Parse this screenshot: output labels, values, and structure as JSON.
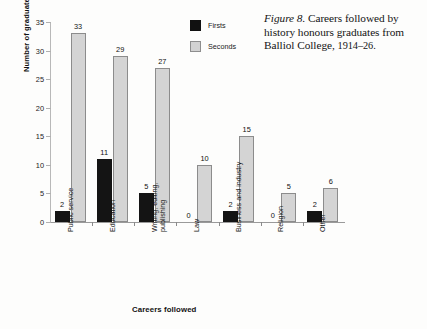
{
  "caption": {
    "figure_label": "Figure 8.",
    "text": " Careers followed by history honours graduates from Balliol College,",
    "years": "1914–26."
  },
  "legend": {
    "position": "inside-top-center",
    "items": [
      {
        "name": "Firsts",
        "color": "#141414"
      },
      {
        "name": "Seconds",
        "color": "#d4d4d4"
      }
    ]
  },
  "axes": {
    "ylabel": "Number of graduates",
    "xlabel": "Careers followed",
    "yticks": [
      "0",
      "5",
      "10",
      "15",
      "20",
      "25",
      "30",
      "35"
    ]
  },
  "chart_data": {
    "type": "bar",
    "title": "Careers followed by history honours graduates from Balliol College, 1914–26.",
    "xlabel": "Careers followed",
    "ylabel": "Number of graduates",
    "ylim": [
      0,
      35
    ],
    "ytick_step": 5,
    "grid": false,
    "legend_position": "upper center inside",
    "categories": [
      "Public service",
      "Education",
      "Writing, editing, publishing",
      "Law",
      "Business and industry",
      "Religion",
      "Other"
    ],
    "category_lines": [
      [
        "Public service"
      ],
      [
        "Education"
      ],
      [
        "Writing, editing,",
        "publishing"
      ],
      [
        "Law"
      ],
      [
        "Business and industry"
      ],
      [
        "Religion"
      ],
      [
        "Other"
      ]
    ],
    "series": [
      {
        "name": "Firsts",
        "color": "#141414",
        "values": [
          2,
          11,
          5,
          0,
          2,
          0,
          2
        ]
      },
      {
        "name": "Seconds",
        "color": "#d4d4d4",
        "values": [
          33,
          29,
          27,
          10,
          15,
          5,
          6
        ]
      }
    ],
    "data_labels": {
      "Firsts": [
        "2",
        "11",
        "5",
        "0",
        "2",
        "0",
        "2"
      ],
      "Seconds": [
        "33",
        "29",
        "27",
        "10",
        "15",
        "5",
        "6"
      ]
    }
  }
}
